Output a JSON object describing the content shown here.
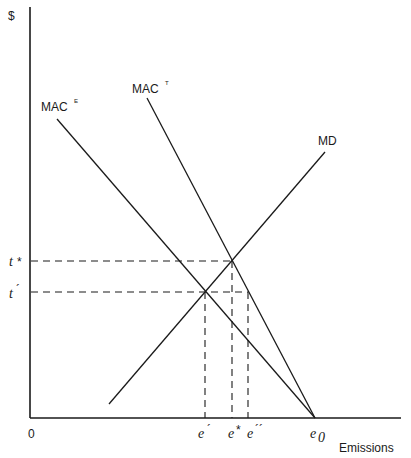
{
  "diagram": {
    "y_axis_label": "$",
    "x_axis_label": "Emissions",
    "origin_label": "0",
    "curves": [
      {
        "id": "mac_e",
        "label": "MAC",
        "superscript": "E",
        "from": [
          57,
          119
        ],
        "to": [
          315,
          418
        ]
      },
      {
        "id": "mac_t",
        "label": "MAC",
        "superscript": "T",
        "from": [
          147,
          98
        ],
        "to": [
          315,
          418
        ]
      },
      {
        "id": "md",
        "label": "MD",
        "from": [
          109,
          404
        ],
        "to": [
          325,
          152
        ]
      }
    ],
    "price_levels": [
      {
        "id": "t_star",
        "label": "t",
        "mark": "*",
        "y": 261,
        "x_end": 232
      },
      {
        "id": "t_prime",
        "label": "t",
        "mark": "´",
        "y": 292,
        "x_end": 248
      }
    ],
    "emission_levels": [
      {
        "id": "e_prime",
        "label": "e",
        "mark": "´",
        "x": 205,
        "y_top": 292
      },
      {
        "id": "e_star",
        "label": "e",
        "mark": "*",
        "x": 232,
        "y_top": 261
      },
      {
        "id": "e_double_prime",
        "label": "e",
        "mark": "´´",
        "x": 248,
        "y_top": 292
      },
      {
        "id": "e_zero",
        "label": "e",
        "subscript": "0",
        "x": 315
      }
    ],
    "intersections": [
      {
        "name": "MAC_E x MD",
        "point": [
          205,
          292
        ]
      },
      {
        "name": "MAC_T x MD",
        "point": [
          232,
          261
        ]
      }
    ]
  }
}
